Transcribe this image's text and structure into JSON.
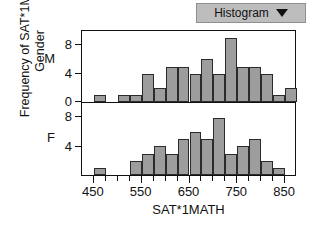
{
  "toolbar": {
    "dropdown_label": "Histogram",
    "dropdown_icon": "chevron-down-icon"
  },
  "chart_data": {
    "type": "bar",
    "title": "",
    "xlabel": "SAT*1MATH",
    "ylabel": "Frequency of SAT*1M...\nGender",
    "ylabel_line1": "Frequency of SAT*1M...",
    "ylabel_line2": "Gender",
    "xlim": [
      425,
      875
    ],
    "xticks_major": [
      450,
      550,
      650,
      750,
      850
    ],
    "xticks_minor": [
      475,
      500,
      525,
      575,
      600,
      625,
      675,
      700,
      725,
      775,
      800,
      825
    ],
    "bin_width": 25,
    "grid": false,
    "legend": "none",
    "panels": [
      {
        "name": "M",
        "group_label": "M",
        "ylim": [
          0,
          10
        ],
        "yticks": [
          0,
          4,
          8
        ],
        "bins": [
          {
            "x0": 450,
            "x1": 475,
            "count": 1
          },
          {
            "x0": 500,
            "x1": 525,
            "count": 1
          },
          {
            "x0": 525,
            "x1": 550,
            "count": 1
          },
          {
            "x0": 550,
            "x1": 575,
            "count": 4
          },
          {
            "x0": 575,
            "x1": 600,
            "count": 2
          },
          {
            "x0": 600,
            "x1": 625,
            "count": 5
          },
          {
            "x0": 625,
            "x1": 650,
            "count": 5
          },
          {
            "x0": 650,
            "x1": 675,
            "count": 4
          },
          {
            "x0": 675,
            "x1": 700,
            "count": 6
          },
          {
            "x0": 700,
            "x1": 725,
            "count": 4
          },
          {
            "x0": 725,
            "x1": 750,
            "count": 9
          },
          {
            "x0": 750,
            "x1": 775,
            "count": 5
          },
          {
            "x0": 775,
            "x1": 800,
            "count": 5
          },
          {
            "x0": 800,
            "x1": 825,
            "count": 4
          },
          {
            "x0": 825,
            "x1": 850,
            "count": 1
          },
          {
            "x0": 850,
            "x1": 875,
            "count": 2
          }
        ]
      },
      {
        "name": "F",
        "group_label": "F",
        "ylim": [
          0,
          10
        ],
        "yticks": [
          4,
          8
        ],
        "bins": [
          {
            "x0": 450,
            "x1": 475,
            "count": 1
          },
          {
            "x0": 525,
            "x1": 550,
            "count": 2
          },
          {
            "x0": 550,
            "x1": 575,
            "count": 3
          },
          {
            "x0": 575,
            "x1": 600,
            "count": 4
          },
          {
            "x0": 600,
            "x1": 625,
            "count": 3
          },
          {
            "x0": 625,
            "x1": 650,
            "count": 5
          },
          {
            "x0": 650,
            "x1": 675,
            "count": 6
          },
          {
            "x0": 675,
            "x1": 700,
            "count": 5
          },
          {
            "x0": 700,
            "x1": 725,
            "count": 8
          },
          {
            "x0": 725,
            "x1": 750,
            "count": 3
          },
          {
            "x0": 750,
            "x1": 775,
            "count": 4
          },
          {
            "x0": 775,
            "x1": 800,
            "count": 5
          },
          {
            "x0": 800,
            "x1": 825,
            "count": 2
          },
          {
            "x0": 825,
            "x1": 850,
            "count": 1
          }
        ]
      }
    ]
  }
}
